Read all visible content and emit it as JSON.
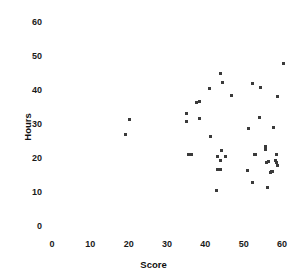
{
  "chart_data": {
    "type": "scatter",
    "title": "",
    "xlabel": "Score",
    "ylabel": "Hours",
    "xlim": [
      0,
      63
    ],
    "ylim": [
      0,
      63
    ],
    "xticks": [
      0,
      10,
      20,
      30,
      40,
      50,
      60
    ],
    "yticks": [
      0,
      10,
      20,
      30,
      40,
      50,
      60
    ],
    "xtick_labels": [
      "0",
      "10",
      "20",
      "30",
      "40",
      "50",
      "60"
    ],
    "ytick_labels": [
      "0",
      "10",
      "20",
      "30",
      "40",
      "50",
      "60"
    ],
    "grid": false,
    "legend": null,
    "marker": "square",
    "marker_color": "#3a3a3a",
    "marker_size": 3,
    "points": [
      {
        "x": 19.2,
        "y": 26.8
      },
      {
        "x": 20.3,
        "y": 31.3
      },
      {
        "x": 35.1,
        "y": 33.2
      },
      {
        "x": 35.1,
        "y": 30.6
      },
      {
        "x": 35.6,
        "y": 21.0
      },
      {
        "x": 36.4,
        "y": 21.0
      },
      {
        "x": 37.6,
        "y": 36.3
      },
      {
        "x": 38.4,
        "y": 36.6
      },
      {
        "x": 38.4,
        "y": 31.5
      },
      {
        "x": 41.2,
        "y": 40.5
      },
      {
        "x": 41.4,
        "y": 26.2
      },
      {
        "x": 43.0,
        "y": 10.5
      },
      {
        "x": 43.2,
        "y": 20.4
      },
      {
        "x": 43.2,
        "y": 16.6
      },
      {
        "x": 43.9,
        "y": 16.6
      },
      {
        "x": 43.9,
        "y": 19.4
      },
      {
        "x": 43.9,
        "y": 44.9
      },
      {
        "x": 44.3,
        "y": 22.2
      },
      {
        "x": 44.6,
        "y": 42.1
      },
      {
        "x": 45.3,
        "y": 20.4
      },
      {
        "x": 46.9,
        "y": 38.3
      },
      {
        "x": 50.9,
        "y": 16.4
      },
      {
        "x": 51.3,
        "y": 28.7
      },
      {
        "x": 52.2,
        "y": 12.8
      },
      {
        "x": 52.4,
        "y": 41.9
      },
      {
        "x": 52.7,
        "y": 21.1
      },
      {
        "x": 53.0,
        "y": 20.9
      },
      {
        "x": 54.0,
        "y": 31.9
      },
      {
        "x": 54.3,
        "y": 40.7
      },
      {
        "x": 55.6,
        "y": 22.6
      },
      {
        "x": 55.8,
        "y": 23.3
      },
      {
        "x": 56.0,
        "y": 18.7
      },
      {
        "x": 56.2,
        "y": 11.3
      },
      {
        "x": 56.5,
        "y": 19.0
      },
      {
        "x": 57.0,
        "y": 15.6
      },
      {
        "x": 57.3,
        "y": 15.9
      },
      {
        "x": 57.6,
        "y": 16.1
      },
      {
        "x": 57.8,
        "y": 28.9
      },
      {
        "x": 58.3,
        "y": 19.4
      },
      {
        "x": 58.5,
        "y": 21.0
      },
      {
        "x": 58.5,
        "y": 18.6
      },
      {
        "x": 58.8,
        "y": 17.9
      },
      {
        "x": 58.9,
        "y": 38.1
      },
      {
        "x": 60.4,
        "y": 47.8
      }
    ]
  }
}
